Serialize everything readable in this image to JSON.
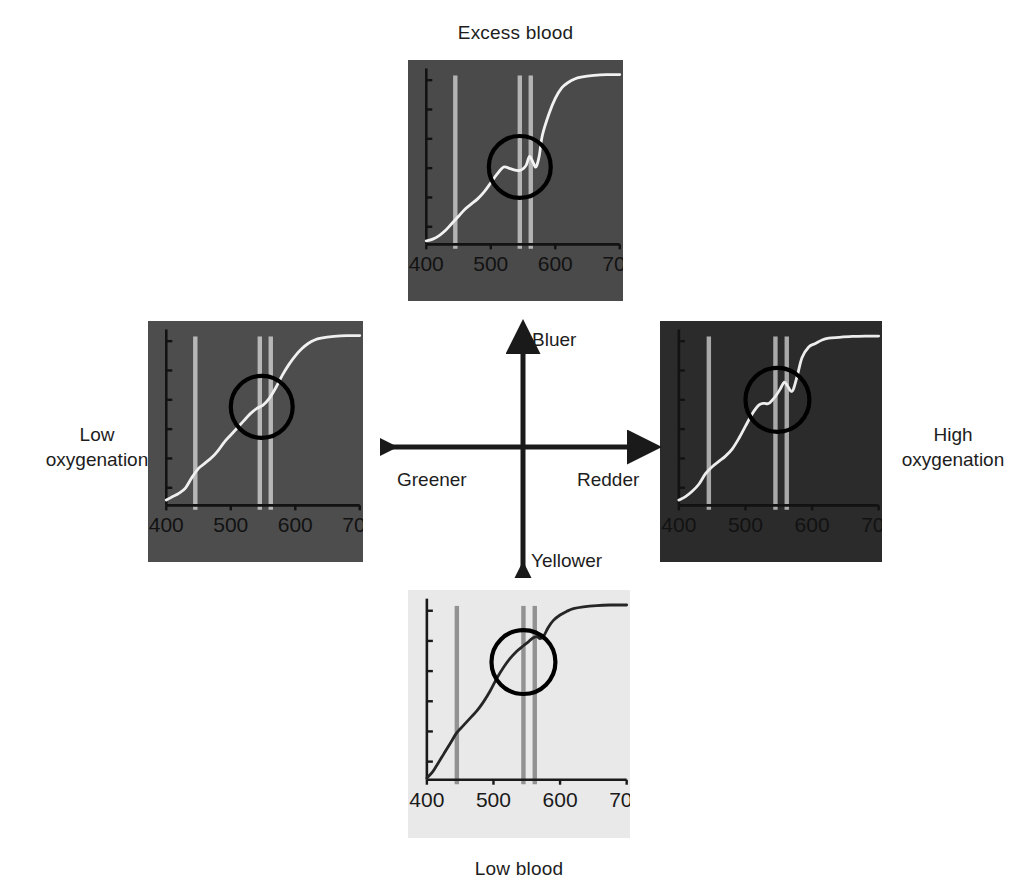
{
  "figure": {
    "type": "color-space-quadrant-diagram"
  },
  "axes": {
    "up_label": "Bluer",
    "down_label": "Yellower",
    "left_label": "Greener",
    "right_label": "Redder"
  },
  "side_labels": {
    "left": "Low\noxygenation",
    "left_line1": "Low",
    "left_line2": "oxygenation",
    "right_line1": "High",
    "right_line2": "oxygenation"
  },
  "panel_titles": {
    "top": "Excess blood",
    "bottom": "Low blood"
  },
  "chart_data": [
    {
      "id": "top",
      "type": "line",
      "title": "Excess blood",
      "position": "top",
      "xlabel": "",
      "ylabel": "",
      "xlim": [
        400,
        700
      ],
      "ylim": [
        0,
        1
      ],
      "xticks": [
        400,
        500,
        600,
        700
      ],
      "xticklabels": [
        "400",
        "500",
        "600",
        "700"
      ],
      "yticks_count": 6,
      "yticklabels": [],
      "grid": false,
      "background_color": "#4a4a4a",
      "curve_color": "#f2f2f2",
      "bar_color": "#b9b9b9",
      "marker_bars_nm": [
        445,
        545,
        562
      ],
      "highlight_circle": {
        "center_nm": 545,
        "center_y": 0.44,
        "radius_nm": 48
      },
      "x": [
        400,
        410,
        420,
        430,
        440,
        450,
        460,
        470,
        480,
        490,
        500,
        510,
        520,
        530,
        540,
        545,
        550,
        555,
        560,
        565,
        570,
        575,
        580,
        590,
        600,
        610,
        620,
        630,
        640,
        660,
        680,
        700
      ],
      "y": [
        0.02,
        0.03,
        0.05,
        0.08,
        0.12,
        0.16,
        0.2,
        0.23,
        0.26,
        0.3,
        0.35,
        0.4,
        0.44,
        0.43,
        0.42,
        0.42,
        0.43,
        0.45,
        0.5,
        0.47,
        0.44,
        0.5,
        0.62,
        0.74,
        0.83,
        0.89,
        0.92,
        0.94,
        0.95,
        0.96,
        0.965,
        0.965
      ]
    },
    {
      "id": "left",
      "type": "line",
      "title": "",
      "position": "left",
      "xlabel": "",
      "ylabel": "",
      "xlim": [
        400,
        700
      ],
      "ylim": [
        0,
        1
      ],
      "xticks": [
        400,
        500,
        600,
        700
      ],
      "xticklabels": [
        "400",
        "500",
        "600",
        "700"
      ],
      "yticks_count": 6,
      "yticklabels": [],
      "grid": false,
      "background_color": "#4d4d4d",
      "curve_color": "#f0f0f0",
      "bar_color": "#bdbdbd",
      "marker_bars_nm": [
        445,
        545,
        562
      ],
      "highlight_circle": {
        "center_nm": 548,
        "center_y": 0.56,
        "radius_nm": 48
      },
      "x": [
        400,
        410,
        420,
        430,
        440,
        450,
        460,
        470,
        480,
        490,
        500,
        510,
        520,
        530,
        540,
        550,
        560,
        570,
        580,
        590,
        600,
        610,
        620,
        630,
        640,
        660,
        680,
        700
      ],
      "y": [
        0.03,
        0.05,
        0.07,
        0.1,
        0.16,
        0.21,
        0.24,
        0.27,
        0.31,
        0.36,
        0.4,
        0.44,
        0.48,
        0.52,
        0.55,
        0.57,
        0.61,
        0.67,
        0.74,
        0.8,
        0.85,
        0.89,
        0.92,
        0.94,
        0.95,
        0.96,
        0.965,
        0.965
      ]
    },
    {
      "id": "right",
      "type": "line",
      "title": "",
      "position": "right",
      "xlabel": "",
      "ylabel": "",
      "xlim": [
        400,
        700
      ],
      "ylim": [
        0,
        1
      ],
      "xticks": [
        400,
        500,
        600,
        700
      ],
      "xticklabels": [
        "400",
        "500",
        "600",
        "700"
      ],
      "yticks_count": 6,
      "yticklabels": [],
      "grid": false,
      "background_color": "#2b2b2b",
      "curve_color": "#ededed",
      "bar_color": "#b0b0b0",
      "marker_bars_nm": [
        445,
        545,
        562
      ],
      "highlight_circle": {
        "center_nm": 548,
        "center_y": 0.6,
        "radius_nm": 48
      },
      "x": [
        400,
        410,
        420,
        430,
        440,
        450,
        460,
        470,
        480,
        490,
        500,
        510,
        520,
        528,
        535,
        545,
        552,
        558,
        563,
        568,
        572,
        578,
        585,
        595,
        605,
        615,
        625,
        640,
        660,
        680,
        700
      ],
      "y": [
        0.03,
        0.05,
        0.08,
        0.12,
        0.18,
        0.22,
        0.25,
        0.28,
        0.32,
        0.38,
        0.45,
        0.52,
        0.57,
        0.58,
        0.58,
        0.62,
        0.66,
        0.7,
        0.68,
        0.65,
        0.66,
        0.74,
        0.84,
        0.9,
        0.92,
        0.94,
        0.95,
        0.955,
        0.96,
        0.962,
        0.962
      ]
    },
    {
      "id": "bottom",
      "type": "line",
      "title": "Low blood",
      "position": "bottom",
      "xlabel": "",
      "ylabel": "",
      "xlim": [
        400,
        700
      ],
      "ylim": [
        0,
        1
      ],
      "xticks": [
        400,
        500,
        600,
        700
      ],
      "xticklabels": [
        "400",
        "500",
        "600",
        "700"
      ],
      "yticks_count": 6,
      "yticklabels": [],
      "grid": false,
      "background_color": "#e9e9e9",
      "curve_color": "#262626",
      "bar_color": "#8d8d8d",
      "marker_bars_nm": [
        445,
        545,
        562
      ],
      "highlight_circle": {
        "center_nm": 545,
        "center_y": 0.65,
        "radius_nm": 48
      },
      "x": [
        400,
        408,
        415,
        425,
        435,
        445,
        455,
        465,
        475,
        485,
        495,
        505,
        515,
        525,
        535,
        545,
        552,
        558,
        565,
        570,
        575,
        582,
        590,
        600,
        610,
        620,
        635,
        655,
        675,
        700
      ],
      "y": [
        0.01,
        0.04,
        0.08,
        0.14,
        0.2,
        0.26,
        0.3,
        0.34,
        0.38,
        0.43,
        0.49,
        0.56,
        0.62,
        0.67,
        0.71,
        0.74,
        0.76,
        0.78,
        0.79,
        0.78,
        0.79,
        0.84,
        0.88,
        0.91,
        0.93,
        0.945,
        0.955,
        0.962,
        0.965,
        0.965
      ]
    }
  ],
  "colors": {
    "arrow": "#1a1a1a",
    "text": "#1d1d1d",
    "page_background": "#ffffff",
    "circle_outline": "#000000"
  }
}
